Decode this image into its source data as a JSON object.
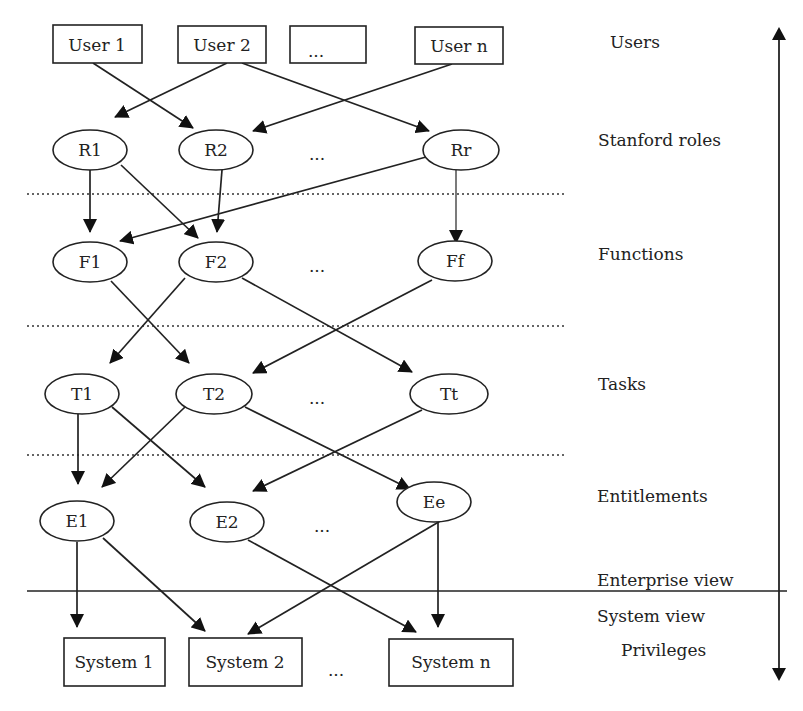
{
  "diagram": {
    "layers": [
      {
        "id": "users",
        "label": "Users"
      },
      {
        "id": "roles",
        "label": "Stanford roles"
      },
      {
        "id": "functions",
        "label": "Functions"
      },
      {
        "id": "tasks",
        "label": "Tasks"
      },
      {
        "id": "entitlements",
        "label": "Entitlements"
      },
      {
        "id": "enterprise",
        "label": "Enterprise view"
      },
      {
        "id": "system",
        "label": "System view"
      },
      {
        "id": "privileges",
        "label": "Privileges"
      }
    ],
    "users": [
      "User 1",
      "User 2",
      "...",
      "User n"
    ],
    "roles": [
      "R1",
      "R2",
      "...",
      "Rr"
    ],
    "functions": [
      "F1",
      "F2",
      "...",
      "Ff"
    ],
    "tasks": [
      "T1",
      "T2",
      "...",
      "Tt"
    ],
    "entitlements": [
      "E1",
      "E2",
      "...",
      "Ee"
    ],
    "systems": [
      "System 1",
      "System 2",
      "...",
      "System n"
    ],
    "edges": [
      [
        "User 1",
        "R2"
      ],
      [
        "User 2",
        "R1"
      ],
      [
        "User 2",
        "Rr"
      ],
      [
        "User n",
        "R2"
      ],
      [
        "R1",
        "F1"
      ],
      [
        "R1",
        "F2"
      ],
      [
        "R2",
        "F2"
      ],
      [
        "Rr",
        "F1"
      ],
      [
        "Rr",
        "Ff"
      ],
      [
        "F1",
        "T2"
      ],
      [
        "F2",
        "T1"
      ],
      [
        "F2",
        "Tt"
      ],
      [
        "Ff",
        "T2"
      ],
      [
        "T1",
        "E1"
      ],
      [
        "T1",
        "E2"
      ],
      [
        "T2",
        "E1"
      ],
      [
        "T2",
        "Ee"
      ],
      [
        "Tt",
        "E2"
      ],
      [
        "E1",
        "System 1"
      ],
      [
        "E1",
        "System 2"
      ],
      [
        "E2",
        "System n"
      ],
      [
        "Ee",
        "System 2"
      ],
      [
        "Ee",
        "System n"
      ]
    ]
  }
}
